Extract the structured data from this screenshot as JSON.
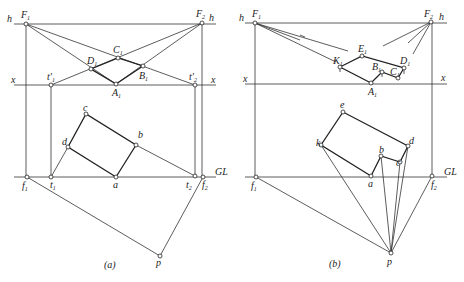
{
  "figure": {
    "panels": [
      {
        "caption": "(a)",
        "labels": {
          "h_left": "h",
          "h_right": "h",
          "x_left": "x",
          "x_right": "x",
          "gl": "GL",
          "F1": "F",
          "F1_sub": "1",
          "F2": "F",
          "F2_sub": "2",
          "C1": "C",
          "C1_sub": "1",
          "D1": "D",
          "D1_sub": "1",
          "B1": "B",
          "B1_sub": "1",
          "A1": "A",
          "A1_sub": "1",
          "tp1": "t'",
          "tp1_sub": "1",
          "tp2": "t'",
          "tp2_sub": "2",
          "c": "c",
          "b": "b",
          "d": "d",
          "a": "a",
          "f1": "f",
          "f1_sub": "1",
          "t1": "t",
          "t1_sub": "1",
          "t2": "t",
          "t2_sub": "2",
          "f2": "f",
          "f2_sub": "2",
          "p": "p"
        }
      },
      {
        "caption": "(b)",
        "labels": {
          "h_left": "h",
          "h_right": "h",
          "x_left": "x",
          "x_right": "x",
          "gl": "GL",
          "F1": "F",
          "F1_sub": "1",
          "F2": "F",
          "F2_sub": "2",
          "E1": "E",
          "E1_sub": "1",
          "K1": "K",
          "K1_sub": "1",
          "B1": "B",
          "B1_sub": "1",
          "D1": "D",
          "D1_sub": "1",
          "C1": "C",
          "C1_sub": "1",
          "A1": "A",
          "A1_sub": "1",
          "e": "e",
          "k": "k",
          "b": "b",
          "c": "c",
          "d": "d",
          "a": "a",
          "f1": "f",
          "f1_sub": "1",
          "f2": "f",
          "f2_sub": "2",
          "p": "p"
        }
      }
    ]
  }
}
